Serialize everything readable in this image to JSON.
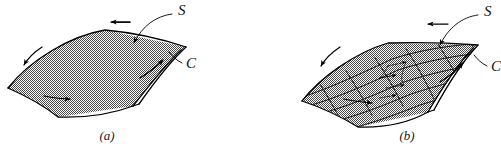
{
  "figure": {
    "background_color": "#ffffff",
    "ink_color": "#000000",
    "surface_fill_color": "#a8a8a8",
    "surface_texture": "fine-checkerboard-halftone",
    "panels": [
      {
        "id": "a",
        "caption": "(a)",
        "caption_x": 107,
        "caption_y": 140,
        "description": "smooth oriented surface with boundary curve",
        "labels": [
          {
            "name": "surface-label-s",
            "text": "S",
            "x": 178,
            "y": 15
          },
          {
            "name": "boundary-label-c",
            "text": "C",
            "x": 186,
            "y": 68
          }
        ],
        "orientation_arrows": [
          {
            "name": "top-edge-arrow",
            "direction": "left"
          },
          {
            "name": "left-edge-arrow",
            "direction": "down-left"
          },
          {
            "name": "bottom-edge-arrow",
            "direction": "right"
          },
          {
            "name": "right-edge-arrow",
            "direction": "up-right"
          }
        ]
      },
      {
        "id": "b",
        "caption": "(b)",
        "caption_x": 407,
        "caption_y": 140,
        "description": "same surface subdivided into a curvilinear grid of cells with interior circulations",
        "grid": {
          "rows": 5,
          "cols": 6
        },
        "labels": [
          {
            "name": "surface-label-s",
            "text": "S",
            "x": 484,
            "y": 16
          },
          {
            "name": "boundary-label-c",
            "text": "C",
            "x": 491,
            "y": 71
          }
        ],
        "orientation_arrows": [
          {
            "name": "top-edge-arrow",
            "direction": "left"
          },
          {
            "name": "left-edge-arrow",
            "direction": "down-left"
          },
          {
            "name": "bottom-edge-arrow",
            "direction": "right"
          },
          {
            "name": "right-edge-arrow",
            "direction": "up-right"
          }
        ],
        "interior_cell_arrows": 4
      }
    ]
  }
}
